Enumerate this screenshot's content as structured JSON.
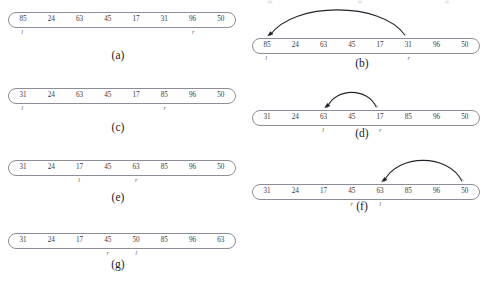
{
  "figure": {
    "title": "",
    "slot_count": 8,
    "pointer_symbols": {
      "left": "l",
      "right": "r"
    }
  },
  "panels": [
    {
      "id": "a",
      "caption": "(a)",
      "values": [
        "85",
        "24",
        "63",
        "45",
        "17",
        "31",
        "96",
        "50"
      ],
      "pointers": {
        "l": 0,
        "r": 6
      },
      "arrow": null
    },
    {
      "id": "b",
      "caption": "(b)",
      "values": [
        "85",
        "24",
        "63",
        "45",
        "17",
        "31",
        "96",
        "50"
      ],
      "pointers": {
        "l": 0,
        "r": 5
      },
      "arrow": {
        "from": 0,
        "to": 5,
        "double": true
      }
    },
    {
      "id": "c",
      "caption": "(c)",
      "values": [
        "31",
        "24",
        "63",
        "45",
        "17",
        "85",
        "96",
        "50"
      ],
      "pointers": {
        "l": 0,
        "r": 5
      },
      "arrow": null
    },
    {
      "id": "d",
      "caption": "(d)",
      "values": [
        "31",
        "24",
        "63",
        "45",
        "17",
        "85",
        "96",
        "50"
      ],
      "pointers": {
        "l": 2,
        "r": 4
      },
      "arrow": {
        "from": 2,
        "to": 4,
        "double": true
      }
    },
    {
      "id": "e",
      "caption": "(e)",
      "values": [
        "31",
        "24",
        "17",
        "45",
        "63",
        "85",
        "96",
        "50"
      ],
      "pointers": {
        "l": 2,
        "r": 4
      },
      "arrow": null
    },
    {
      "id": "f",
      "caption": "(f)",
      "values": [
        "31",
        "24",
        "17",
        "45",
        "63",
        "85",
        "96",
        "50"
      ],
      "pointers": {
        "l": 4,
        "r": 3
      },
      "arrow": {
        "from": 4,
        "to": 7,
        "double": true
      }
    },
    {
      "id": "g",
      "caption": "(g)",
      "values": [
        "31",
        "24",
        "17",
        "45",
        "50",
        "85",
        "96",
        "63"
      ],
      "pointers": {
        "l": 4,
        "r": 3
      },
      "arrow": null
    }
  ],
  "colors": {
    "capsule_border": "#8d8d99",
    "text": "#3a3a45",
    "arrow": "#23232c",
    "background": "#ffffff"
  }
}
